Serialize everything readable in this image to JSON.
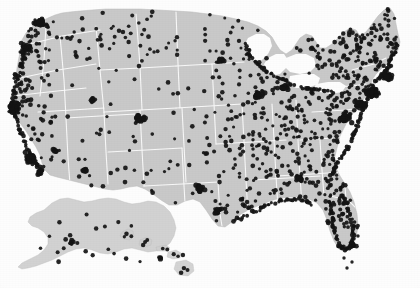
{
  "figure": {
    "kind": "dot-density-map",
    "region": "United States of America",
    "insets": [
      "Alaska",
      "Hawaii"
    ],
    "caption": "",
    "has_legend": false,
    "has_axes": false,
    "has_labels": false
  },
  "colors": {
    "background": "#fdfdfd",
    "land_fill": "#c9c9c9",
    "land_fill_inset": "#cfcfcf",
    "state_border": "#fbfbfb",
    "water_fill": "#fdfdfd",
    "dot_color": "#141414",
    "coast_edge": "#b8b8b8"
  },
  "chart_data": {
    "type": "scatter",
    "subtitle": "",
    "xlabel": "",
    "ylabel": "",
    "legend_position": "none",
    "grid": false,
    "projection": "albers-usa",
    "marker": {
      "shape": "circle",
      "radius_px": 2.0,
      "color": "#141414",
      "opacity": 0.92
    },
    "xlim": [
      0,
      420
    ],
    "ylim": [
      0,
      288
    ],
    "point_count_approx": 1100,
    "density_notes": [
      "Highest density along the Boston-New York-Philadelphia-Washington northeast corridor",
      "Dense clusters on the California coast at San Francisco Bay and Los Angeles / San Diego",
      "Dense cluster in the Puget Sound / Seattle area",
      "Dense ring around the southern Great Lakes including Chicago and Detroit",
      "Coastal Florida outline heavily populated with points",
      "Interior Mountain West and Great Plains are sparse",
      "Alaska and Hawaii insets carry a small number of points"
    ],
    "clusters": [
      {
        "name": "Seattle / Puget Sound",
        "x": 40,
        "y": 22,
        "count": 34
      },
      {
        "name": "Portland",
        "x": 28,
        "y": 48,
        "count": 18
      },
      {
        "name": "San Francisco Bay Area",
        "x": 13,
        "y": 108,
        "count": 46
      },
      {
        "name": "Los Angeles",
        "x": 30,
        "y": 158,
        "count": 52
      },
      {
        "name": "San Diego",
        "x": 40,
        "y": 172,
        "count": 14
      },
      {
        "name": "Las Vegas",
        "x": 55,
        "y": 150,
        "count": 8
      },
      {
        "name": "Phoenix",
        "x": 85,
        "y": 170,
        "count": 12
      },
      {
        "name": "Salt Lake City",
        "x": 92,
        "y": 100,
        "count": 9
      },
      {
        "name": "Denver",
        "x": 140,
        "y": 118,
        "count": 28
      },
      {
        "name": "Dallas-Fort Worth",
        "x": 200,
        "y": 188,
        "count": 26
      },
      {
        "name": "Houston",
        "x": 218,
        "y": 212,
        "count": 16
      },
      {
        "name": "Minneapolis",
        "x": 222,
        "y": 60,
        "count": 14
      },
      {
        "name": "Chicago",
        "x": 258,
        "y": 95,
        "count": 30
      },
      {
        "name": "Detroit",
        "x": 285,
        "y": 88,
        "count": 20
      },
      {
        "name": "Atlanta",
        "x": 300,
        "y": 178,
        "count": 18
      },
      {
        "name": "Miami / South Florida",
        "x": 353,
        "y": 245,
        "count": 16
      },
      {
        "name": "Washington DC / Baltimore",
        "x": 345,
        "y": 118,
        "count": 40
      },
      {
        "name": "Philadelphia",
        "x": 360,
        "y": 105,
        "count": 36
      },
      {
        "name": "New York City",
        "x": 372,
        "y": 92,
        "count": 58
      },
      {
        "name": "Boston",
        "x": 388,
        "y": 76,
        "count": 34
      },
      {
        "name": "Anchorage (Alaska inset)",
        "x": 72,
        "y": 242,
        "count": 6
      },
      {
        "name": "Honolulu (Hawaii inset)",
        "x": 160,
        "y": 258,
        "count": 5
      }
    ]
  }
}
